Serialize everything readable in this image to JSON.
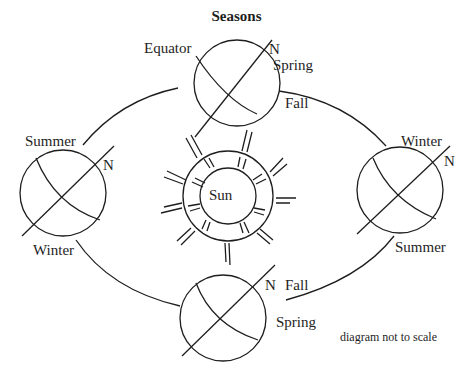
{
  "title": "Seasons",
  "sun_label": "Sun",
  "note": "diagram not to scale",
  "earths": {
    "top": {
      "equator_label": "Equator",
      "north_label": "N",
      "season_above": "Spring",
      "season_below": "Fall"
    },
    "left": {
      "north_label": "N",
      "season_above": "Summer",
      "season_below": "Winter"
    },
    "right": {
      "north_label": "N",
      "season_above": "Winter",
      "season_below": "Summer"
    },
    "bottom": {
      "north_label": "N",
      "season_above": "Fall",
      "season_below": "Spring"
    }
  },
  "colors": {
    "stroke": "#1e1e1e",
    "background": "#ffffff"
  }
}
